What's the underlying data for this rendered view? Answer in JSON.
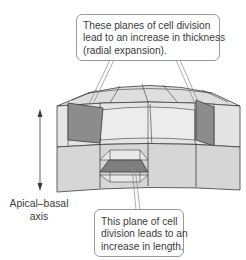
{
  "figure": {
    "type": "3D cell-division planes diagram (shoot apex / cylindrical tissue)",
    "colors": {
      "cell_light": "#e6e6e6",
      "cell_mid": "#d2d2d2",
      "cell_top": "#dcdcdc",
      "highlighted_plane": "#8a8a8a",
      "outline": "#3c3c3c",
      "callout_border": "#9a9a9a",
      "text": "#3b3b3b"
    }
  },
  "callouts": {
    "radial": {
      "lines": [
        "These planes of cell division",
        "lead to an increase in thickness",
        "(radial expansion)."
      ]
    },
    "length": {
      "lines": [
        "This plane of cell",
        "division leads to an",
        "increase in length."
      ]
    }
  },
  "axis": {
    "label_lines": [
      "Apical–basal",
      "axis"
    ],
    "arrow": "double-headed vertical arrow"
  }
}
